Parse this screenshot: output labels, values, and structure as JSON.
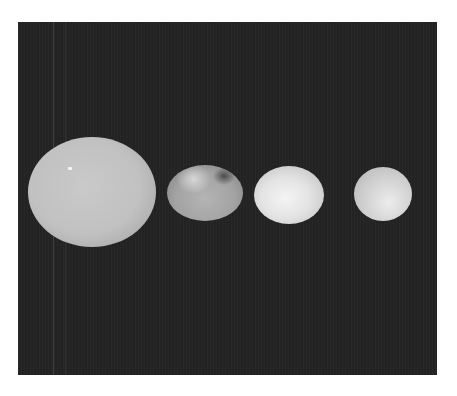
{
  "image": {
    "description": "Four small solar system bodies photographed against a dark background, arranged left to right by size",
    "background_color": "#232323",
    "frame_color": "#ffffff",
    "bodies": [
      {
        "name": "body-1",
        "cx": 92,
        "cy": 192,
        "rx": 64,
        "ry": 55,
        "tone": "#c1c1c1"
      },
      {
        "name": "body-2",
        "cx": 205,
        "cy": 193,
        "rx": 38,
        "ry": 28,
        "tone": "#a3a3a3"
      },
      {
        "name": "body-3",
        "cx": 289,
        "cy": 195,
        "rx": 35,
        "ry": 29,
        "tone": "#e3e3e3"
      },
      {
        "name": "body-4",
        "cx": 383,
        "cy": 194,
        "rx": 29,
        "ry": 27,
        "tone": "#d6d6d6"
      }
    ]
  }
}
